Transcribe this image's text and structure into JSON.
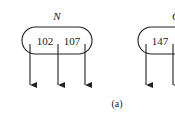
{
  "diagram": {
    "caption": "(a)",
    "nodes": [
      {
        "label": "N",
        "keys": [
          "102",
          "107"
        ],
        "pointers": 3
      },
      {
        "label": "Q",
        "keys": [
          "147"
        ],
        "pointers": 2
      }
    ]
  }
}
